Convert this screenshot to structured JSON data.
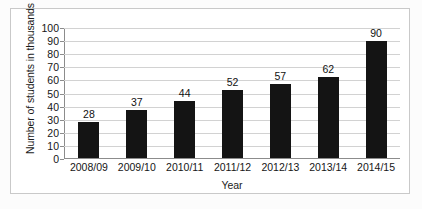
{
  "chart_data": {
    "type": "bar",
    "title": "",
    "xlabel": "Year",
    "ylabel": "Number of students in thousands",
    "categories": [
      "2008/09",
      "2009/10",
      "2010/11",
      "2011/12",
      "2012/13",
      "2013/14",
      "2014/15"
    ],
    "values": [
      28,
      37,
      44,
      52,
      57,
      62,
      90
    ],
    "value_labels": [
      "28",
      "37",
      "44",
      "52",
      "57",
      "62",
      "90"
    ],
    "ylim": [
      0,
      100
    ],
    "ytick_labels": [
      "100",
      "90",
      "80",
      "70",
      "60",
      "50",
      "40",
      "30",
      "20",
      "10",
      "0"
    ],
    "ytick_values": [
      100,
      90,
      80,
      70,
      60,
      50,
      40,
      30,
      20,
      10,
      0
    ],
    "grid": "horizontal",
    "legend": "none",
    "bar_color": "#141414",
    "grid_color": "#d2d2d2",
    "axis_color": "#8c8c8c",
    "background": "#ffffff"
  }
}
